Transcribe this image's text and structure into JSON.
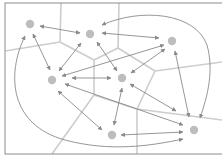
{
  "diagram": {
    "type": "voronoi-network",
    "colors": {
      "background": "#ffffff",
      "frame": "#8c8c8c",
      "voronoi": "#cdcdcd",
      "arrow": "#8a8a8a",
      "node": "#bdbdbd"
    },
    "frame": {
      "x": 5,
      "y": 3,
      "w": 222,
      "h": 151
    },
    "nodes": [
      {
        "id": "A",
        "x": 30,
        "y": 24
      },
      {
        "id": "B",
        "x": 90,
        "y": 34
      },
      {
        "id": "C",
        "x": 172,
        "y": 41
      },
      {
        "id": "D",
        "x": 52,
        "y": 80
      },
      {
        "id": "E",
        "x": 122,
        "y": 78
      },
      {
        "id": "F",
        "x": 112,
        "y": 135
      },
      {
        "id": "G",
        "x": 194,
        "y": 130
      }
    ],
    "voronoi_edges": [
      [
        61,
        3,
        60,
        42
      ],
      [
        60,
        42,
        5,
        51
      ],
      [
        60,
        42,
        94,
        60
      ],
      [
        119,
        3,
        118,
        48
      ],
      [
        118,
        48,
        94,
        60
      ],
      [
        118,
        48,
        155,
        71
      ],
      [
        155,
        71,
        222,
        62
      ],
      [
        94,
        60,
        94,
        95
      ],
      [
        94,
        95,
        52,
        154
      ],
      [
        94,
        95,
        137,
        109
      ],
      [
        155,
        71,
        137,
        109
      ],
      [
        137,
        109,
        137,
        154
      ],
      [
        137,
        109,
        222,
        120
      ]
    ],
    "arrows": [
      {
        "from": "A",
        "to": "B",
        "x1": 40,
        "y1": 26,
        "x2": 80,
        "y2": 33
      },
      {
        "from": "A",
        "to": "D",
        "x1": 33,
        "y1": 34,
        "x2": 50,
        "y2": 70
      },
      {
        "from": "B",
        "to": "D",
        "x1": 81,
        "y1": 43,
        "x2": 59,
        "y2": 71
      },
      {
        "from": "B",
        "to": "E",
        "x1": 97,
        "y1": 42,
        "x2": 117,
        "y2": 71
      },
      {
        "from": "B",
        "to": "C",
        "x1": 102,
        "y1": 33,
        "x2": 159,
        "y2": 38
      },
      {
        "from": "C",
        "to": "D",
        "x1": 164,
        "y1": 45,
        "x2": 62,
        "y2": 76
      },
      {
        "from": "C",
        "to": "E",
        "x1": 165,
        "y1": 49,
        "x2": 131,
        "y2": 73
      },
      {
        "from": "D",
        "to": "E",
        "x1": 72,
        "y1": 78,
        "x2": 111,
        "y2": 78
      },
      {
        "from": "D",
        "to": "G",
        "x1": 65,
        "y1": 84,
        "x2": 183,
        "y2": 125
      },
      {
        "from": "D",
        "to": "F",
        "x1": 58,
        "y1": 91,
        "x2": 102,
        "y2": 130
      },
      {
        "from": "E",
        "to": "F",
        "x1": 122,
        "y1": 88,
        "x2": 114,
        "y2": 125
      },
      {
        "from": "E",
        "to": "G",
        "x1": 130,
        "y1": 84,
        "x2": 176,
        "y2": 111
      },
      {
        "from": "C",
        "to": "G",
        "x1": 175,
        "y1": 51,
        "x2": 189,
        "y2": 117
      },
      {
        "from": "F",
        "to": "G",
        "x1": 121,
        "y1": 135,
        "x2": 183,
        "y2": 132
      }
    ],
    "curved_arrows": [
      {
        "from": "B",
        "to": "G",
        "path": "M102,25 C140,8 195,12 207,45 C214,70 208,95 200,118"
      },
      {
        "from": "A",
        "to": "G",
        "path": "M25,36 C6,75 10,125 65,140 C110,152 150,146 183,139"
      }
    ]
  }
}
